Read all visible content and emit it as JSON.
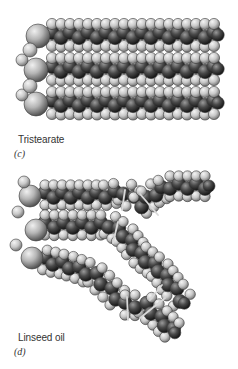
{
  "figure": {
    "panels": [
      {
        "id": "c",
        "panel_letter": "(c)",
        "caption": "Tristearate",
        "caption_pos": [
          18,
          134
        ],
        "letter_pos": [
          14,
          148
        ],
        "glycerol": [
          [
            38,
            36,
            12
          ],
          [
            36,
            70,
            12
          ],
          [
            36,
            104,
            12
          ],
          [
            22,
            60,
            6
          ],
          [
            22,
            95,
            6
          ],
          [
            30,
            50,
            7
          ],
          [
            30,
            86,
            7
          ]
        ],
        "chains": [
          {
            "type": "straight",
            "y": 35,
            "x_start": 52,
            "x_end": 214,
            "step": 18
          },
          {
            "type": "straight",
            "y": 69,
            "x_start": 52,
            "x_end": 214,
            "step": 18
          },
          {
            "type": "straight",
            "y": 103,
            "x_start": 52,
            "x_end": 214,
            "step": 18
          }
        ]
      },
      {
        "id": "d",
        "panel_letter": "(d)",
        "caption": "Linseed oil",
        "caption_pos": [
          18,
          332
        ],
        "letter_pos": [
          14,
          346
        ],
        "glycerol": [
          [
            30,
            196,
            11
          ],
          [
            36,
            230,
            11
          ],
          [
            32,
            258,
            11
          ],
          [
            18,
            212,
            6
          ],
          [
            16,
            245,
            6
          ],
          [
            24,
            182,
            6
          ]
        ],
        "chains": [
          {
            "type": "path",
            "points": [
              [
                45,
                195
              ],
              [
                105,
                195
              ],
              [
                125,
                192
              ],
              [
                140,
                205
              ],
              [
                155,
                193
              ],
              [
                170,
                186
              ],
              [
                205,
                186
              ]
            ],
            "step": 9
          },
          {
            "type": "path",
            "points": [
              [
                45,
                225
              ],
              [
                110,
                225
              ],
              [
                125,
                235
              ],
              [
                140,
                255
              ],
              [
                160,
                270
              ],
              [
                175,
                290
              ],
              [
                182,
                300
              ]
            ],
            "step": 9
          },
          {
            "type": "path",
            "points": [
              [
                45,
                260
              ],
              [
                70,
                266
              ],
              [
                95,
                275
              ],
              [
                110,
                290
              ],
              [
                125,
                305
              ],
              [
                145,
                305
              ],
              [
                160,
                318
              ],
              [
                172,
                330
              ]
            ],
            "step": 9
          }
        ],
        "double_bonds": [
          [
            125,
            190,
            122,
            210
          ],
          [
            140,
            194,
            158,
            215
          ],
          [
            118,
            222,
            113,
            243
          ],
          [
            150,
            300,
            162,
            285
          ],
          [
            127,
            297,
            128,
            320
          ],
          [
            140,
            318,
            165,
            298
          ]
        ]
      }
    ]
  },
  "colors": {
    "background": "#ffffff",
    "carbon_dark": "#1a1a1a",
    "carbon_mid": "#6e6e6e",
    "hydrogen_light": "#e6e6e6",
    "hydrogen_mid": "#a9a9a9",
    "oxygen_light": "#d9d9d9",
    "outline": "#3a3a3a",
    "text": "#333333"
  }
}
